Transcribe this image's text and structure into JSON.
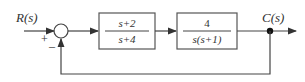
{
  "diagram": {
    "type": "block-diagram",
    "input_label": "R(s)",
    "output_label": "C(s)",
    "summing_junction": {
      "plus_sign": "+",
      "minus_sign": "–"
    },
    "blocks": [
      {
        "numerator": "s+2",
        "denominator": "s+4"
      },
      {
        "numerator": "4",
        "denominator": "s(s+1)"
      }
    ],
    "feedback": "unity negative feedback",
    "colors": {
      "line": "#444444",
      "background": "#ffffff"
    }
  }
}
